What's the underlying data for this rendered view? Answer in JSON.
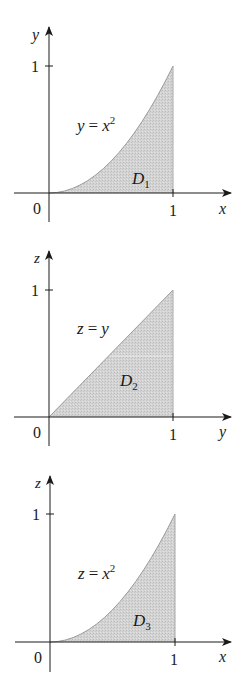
{
  "panels": [
    {
      "id": "D1",
      "vertical_axis": "y",
      "horizontal_axis": "x",
      "origin_label": "0",
      "x_tick_label": "1",
      "y_tick_label": "1",
      "curve_label_lhs": "y",
      "curve_label_eq": "=",
      "curve_label_rhs": "x",
      "curve_label_exp": "2",
      "region_letter": "D",
      "region_sub": "1",
      "boundary": "parabola"
    },
    {
      "id": "D2",
      "vertical_axis": "z",
      "horizontal_axis": "y",
      "origin_label": "0",
      "x_tick_label": "1",
      "y_tick_label": "1",
      "curve_label_lhs": "z",
      "curve_label_eq": "=",
      "curve_label_rhs": "y",
      "curve_label_exp": "",
      "region_letter": "D",
      "region_sub": "2",
      "boundary": "line"
    },
    {
      "id": "D3",
      "vertical_axis": "z",
      "horizontal_axis": "x",
      "origin_label": "0",
      "x_tick_label": "1",
      "y_tick_label": "1",
      "curve_label_lhs": "z",
      "curve_label_eq": "=",
      "curve_label_rhs": "x",
      "curve_label_exp": "2",
      "region_letter": "D",
      "region_sub": "3",
      "boundary": "parabola"
    }
  ],
  "colors": {
    "fill": "#d2d2d2",
    "axis": "#1a1a1a",
    "curve": "#9a9a9a"
  }
}
